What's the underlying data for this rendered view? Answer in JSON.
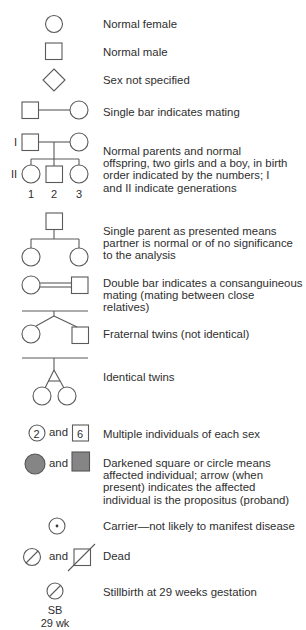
{
  "legend": {
    "entries": [
      {
        "symbol": "circle",
        "text": "Normal female"
      },
      {
        "symbol": "square",
        "text": "Normal male"
      },
      {
        "symbol": "diamond",
        "text": "Sex not specified"
      },
      {
        "symbol": "mating-line",
        "text": "Single bar indicates mating"
      },
      {
        "symbol": "family",
        "text": "Normal parents and normal offspring, two girls and a boy, in birth order indicated by the numbers; I and II indicate generations"
      },
      {
        "symbol": "single-parent",
        "text": "Single parent as presented means partner is normal or of no significance to the analysis"
      },
      {
        "symbol": "double-bar",
        "text": "Double bar indicates a consanguineous mating (mating between close relatives)"
      },
      {
        "symbol": "fraternal-twins",
        "text": "Fraternal twins (not identical)"
      },
      {
        "symbol": "identical-twins",
        "text": "Identical twins"
      },
      {
        "symbol": "multiple",
        "text": "Multiple individuals of each sex"
      },
      {
        "symbol": "affected",
        "text": "Darkened square or circle means affected individual; arrow (when present) indicates the affected individual is the propositus (proband)"
      },
      {
        "symbol": "carrier",
        "text": "Carrier—not likely to manifest disease"
      },
      {
        "symbol": "dead",
        "text": "Dead"
      },
      {
        "symbol": "stillbirth",
        "text": "Stillbirth at 29 weeks gestation"
      }
    ],
    "family_labels": {
      "gen1": "I",
      "gen2": "II",
      "child1": "1",
      "child2": "2",
      "child3": "3"
    },
    "multiple_labels": {
      "female_count": "2",
      "male_count": "6"
    },
    "and_label": "and",
    "stillbirth_labels": {
      "code": "SB",
      "age": "29 wk"
    },
    "colors": {
      "stroke": "#5a5a5a",
      "affected_fill": "#858585",
      "text": "#2e2e2e"
    }
  }
}
